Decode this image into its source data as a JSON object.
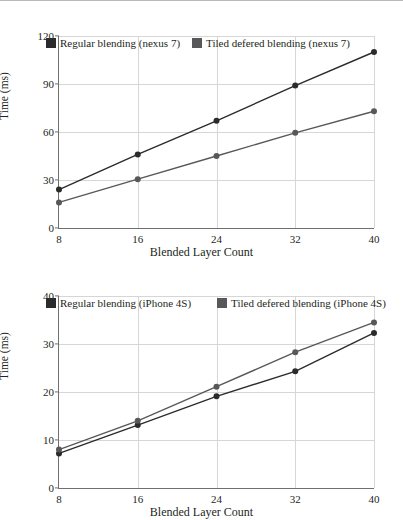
{
  "figure": {
    "count": 2,
    "style": "grayscale line charts with square legend swatches and circular data markers"
  },
  "colors": {
    "series_regular": "#2b2b2b",
    "series_tiled": "#58585a",
    "axis": "#6f6f6f",
    "grid": "#d6d6d6",
    "text": "#231f20",
    "background": "#ffffff"
  },
  "chart_data": [
    {
      "type": "line",
      "title": "",
      "xlabel": "Blended Layer Count",
      "ylabel": "Time (ms)",
      "x": [
        8,
        16,
        24,
        32,
        40
      ],
      "xticks": [
        "8",
        "16",
        "24",
        "32",
        "40"
      ],
      "yticks": [
        "0",
        "30",
        "60",
        "90",
        "120"
      ],
      "xlim": [
        8,
        40
      ],
      "ylim": [
        0,
        120
      ],
      "grid": true,
      "legend_position": "top-left-inside",
      "series": [
        {
          "name": "Regular blending (nexus 7)",
          "color": "#2b2b2b",
          "values": [
            24.0,
            46.0,
            67.0,
            89.0,
            110.0
          ]
        },
        {
          "name": "Tiled defered blending (nexus 7)",
          "color": "#58585a",
          "values": [
            16.0,
            30.5,
            45.0,
            59.5,
            73.0
          ]
        }
      ]
    },
    {
      "type": "line",
      "title": "",
      "xlabel": "Blended Layer Count",
      "ylabel": "Time (ms)",
      "x": [
        8,
        16,
        24,
        32,
        40
      ],
      "xticks": [
        "8",
        "16",
        "24",
        "32",
        "40"
      ],
      "yticks": [
        "0",
        "10",
        "20",
        "30",
        "40"
      ],
      "xlim": [
        8,
        40
      ],
      "ylim": [
        0,
        40
      ],
      "grid": true,
      "legend_position": "top-left-inside",
      "series": [
        {
          "name": "Regular blending (iPhone 4S)",
          "color": "#2b2b2b",
          "values": [
            7.2,
            13.1,
            19.1,
            24.3,
            32.3
          ]
        },
        {
          "name": "Tiled defered blending (iPhone 4S)",
          "color": "#58585a",
          "values": [
            8.0,
            14.0,
            21.1,
            28.3,
            34.5
          ]
        }
      ]
    }
  ]
}
